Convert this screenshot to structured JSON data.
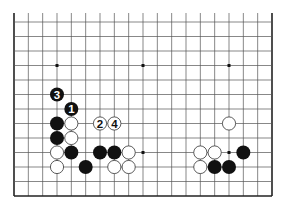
{
  "diagram": {
    "type": "go-board-partial",
    "board_columns": 19,
    "visible_rows": 13,
    "edges": [
      "left",
      "right",
      "bottom"
    ],
    "colors": {
      "background": "#ffffff",
      "grid_line": "#555555",
      "edge_line": "#222222",
      "black_stone": "#111111",
      "white_stone": "#ffffff",
      "white_stone_border": "#333333",
      "star_point": "#111111"
    },
    "star_points": [
      {
        "col": 3,
        "row": 3
      },
      {
        "col": 9,
        "row": 3
      },
      {
        "col": 15,
        "row": 3
      },
      {
        "col": 9,
        "row": 9
      },
      {
        "col": 15,
        "row": 9
      }
    ],
    "stones": [
      {
        "color": "black",
        "col": 3,
        "row": 5,
        "label": "3"
      },
      {
        "color": "black",
        "col": 4,
        "row": 6,
        "label": "1"
      },
      {
        "color": "black",
        "col": 3,
        "row": 7,
        "label": ""
      },
      {
        "color": "white",
        "col": 4,
        "row": 7,
        "label": ""
      },
      {
        "color": "white",
        "col": 6,
        "row": 7,
        "label": "2"
      },
      {
        "color": "white",
        "col": 7,
        "row": 7,
        "label": "4"
      },
      {
        "color": "black",
        "col": 3,
        "row": 8,
        "label": ""
      },
      {
        "color": "white",
        "col": 4,
        "row": 8,
        "label": ""
      },
      {
        "color": "white",
        "col": 3,
        "row": 9,
        "label": ""
      },
      {
        "color": "black",
        "col": 4,
        "row": 9,
        "label": ""
      },
      {
        "color": "black",
        "col": 6,
        "row": 9,
        "label": ""
      },
      {
        "color": "black",
        "col": 7,
        "row": 9,
        "label": ""
      },
      {
        "color": "white",
        "col": 8,
        "row": 9,
        "label": ""
      },
      {
        "color": "white",
        "col": 3,
        "row": 10,
        "label": ""
      },
      {
        "color": "black",
        "col": 5,
        "row": 10,
        "label": ""
      },
      {
        "color": "white",
        "col": 7,
        "row": 10,
        "label": ""
      },
      {
        "color": "white",
        "col": 8,
        "row": 10,
        "label": ""
      },
      {
        "color": "white",
        "col": 15,
        "row": 7,
        "label": ""
      },
      {
        "color": "white",
        "col": 13,
        "row": 9,
        "label": ""
      },
      {
        "color": "white",
        "col": 14,
        "row": 9,
        "label": ""
      },
      {
        "color": "black",
        "col": 16,
        "row": 9,
        "label": ""
      },
      {
        "color": "white",
        "col": 13,
        "row": 10,
        "label": ""
      },
      {
        "color": "black",
        "col": 14,
        "row": 10,
        "label": ""
      },
      {
        "color": "black",
        "col": 15,
        "row": 10,
        "label": ""
      }
    ]
  }
}
